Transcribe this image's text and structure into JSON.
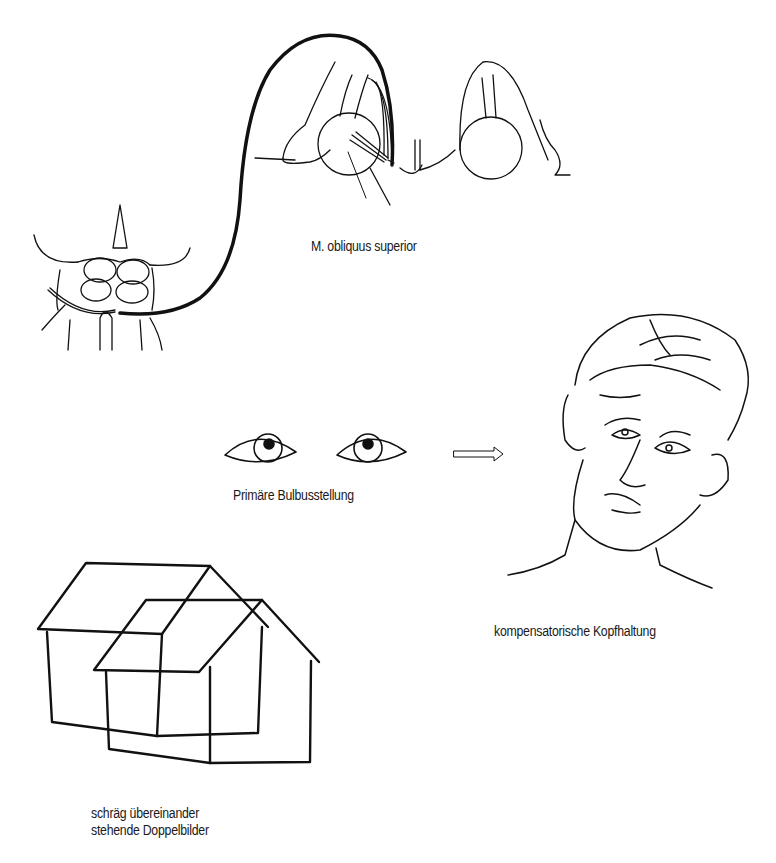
{
  "figure": {
    "panels": [
      {
        "id": "nerve-anatomy",
        "label": "M. obliquus superior"
      },
      {
        "id": "eye-position",
        "label": "Primäre Bulbusstellung"
      },
      {
        "id": "head-posture",
        "label": "kompensatorische Kopfhaltung"
      },
      {
        "id": "double-vision",
        "label_lines": [
          "schräg übereinander",
          "stehende Doppelbilder"
        ]
      }
    ],
    "arrow": {
      "icon": "hollow-arrow-right"
    },
    "colors": {
      "ink": "#111111",
      "background": "#ffffff"
    }
  }
}
